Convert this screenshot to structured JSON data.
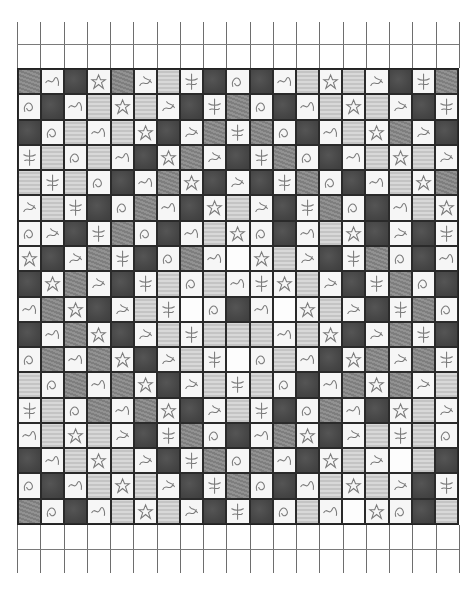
{
  "sheet": {
    "description": "Scanned grid sheet of hand-drawn pencil tiles",
    "columns": 19,
    "tile_rows": 18,
    "empty_rows_top": 2,
    "empty_rows_bottom": 2,
    "tone_legend": {
      "D": "dark shaded tile",
      "M": "medium shaded tile",
      "L": "light textured tile",
      "S": "sketch motif on white",
      "W": "near-blank white tile"
    },
    "colors": {
      "D": "#474747",
      "M": "#888888",
      "L": "#cecece",
      "S": "#f6f6f6",
      "W": "#fdfdfd",
      "grid_line": "#6e6e6e",
      "tile_border": "#2a2a2a"
    },
    "rows": [
      "MSDSMSLSDSDSLSLSDSM",
      "SDSLSLSDSMSDSLSLSDS",
      "DSLSLSDSMSMSDSLSMSD",
      "SLSLSDSMSDSMSDSLSLS",
      "LSLSDSMSDSDSMSDSLSM",
      "SLSDSMSDSLSDSMSDSLS",
      "SSDSMSDSLSSDSLSDSDS",
      "SDSMSDSMSWSLSDSMSDS",
      "DSMSDSLSLSSSLSDSMSD",
      "SMSDSLSWSDSWSLSDSMS",
      "DSMSDSLSLLLSLSDSMSD",
      "SMSMSDSLSWSLSDSMSMS",
      "LSMSMSDSLSLSDSMSMSL",
      "SLSMSMSDSLSDSMSDSLS",
      "SLSLSDSMSDSMSDSLSLS",
      "DSLSLSDSMSMSDSLSWLD",
      "SDSLSLSDSMSDSLSLSDS",
      "MSDSLSLSDSDSLSWSSDL"
    ]
  }
}
